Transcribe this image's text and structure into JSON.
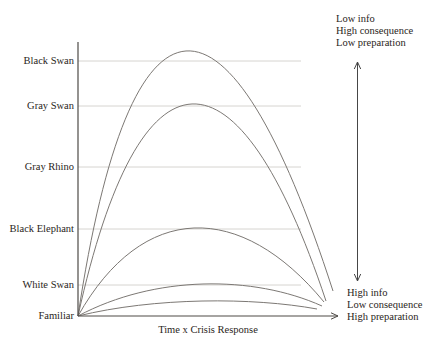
{
  "figure": {
    "x_axis_label": "Time x Crisis Response",
    "y_labels": [
      {
        "label": "Black Swan",
        "y": 61,
        "gridline": true
      },
      {
        "label": "Gray Swan",
        "y": 106,
        "gridline": true
      },
      {
        "label": "Gray Rhino",
        "y": 167,
        "gridline": true
      },
      {
        "label": "Black Elephant",
        "y": 229,
        "gridline": true
      },
      {
        "label": "White Swan",
        "y": 285,
        "gridline": true
      },
      {
        "label": "Familiar",
        "y": 316,
        "gridline": false
      }
    ],
    "annotations": {
      "top": [
        "Low info",
        "High consequence",
        "Low preparation"
      ],
      "bottom": [
        "High info",
        "Low consequence",
        "High preparation"
      ]
    },
    "curves": [
      {
        "name": "black-swan-curve",
        "peak": [
          186,
          51
        ],
        "end": [
          333,
          291
        ]
      },
      {
        "name": "gray-swan-curve",
        "peak": [
          192,
          104
        ],
        "end": [
          326,
          301
        ]
      },
      {
        "name": "black-elephant-curve",
        "peak": [
          194,
          228
        ],
        "end": [
          324,
          302
        ]
      },
      {
        "name": "white-swan-curve",
        "peak": [
          203,
          284
        ],
        "end": [
          322,
          306
        ]
      },
      {
        "name": "familiar-curve",
        "peak": [
          202,
          301
        ],
        "end": [
          317,
          309
        ]
      }
    ],
    "geometry": {
      "origin": {
        "x": 78,
        "y": 316
      },
      "y_axis_top": 42,
      "x_axis_end": 338,
      "gridline_end": 301,
      "v_arrow": {
        "x": 357.5,
        "top": 62,
        "bottom": 281
      },
      "control_spread": 49
    },
    "colors": {
      "background": "#ffffff",
      "text": "#2a2521",
      "axis": "#4e4a46",
      "curve": "#7c7874",
      "gridline": "#ccc9c4",
      "arrow": "#464646"
    }
  }
}
